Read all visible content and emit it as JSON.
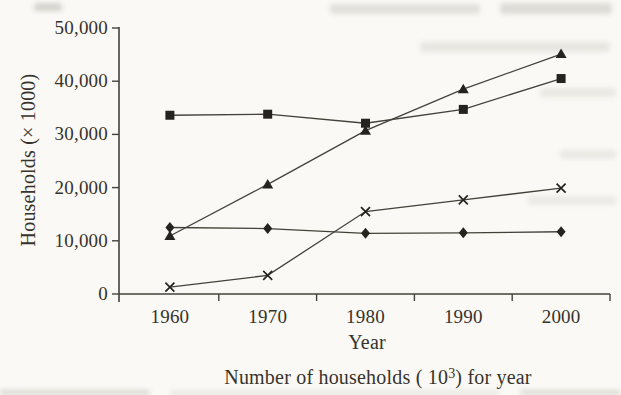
{
  "page": {
    "background_color": "#faf9f5",
    "ink_color": "#37332c",
    "line_color": "#45413a",
    "marker_color": "#26231e"
  },
  "chart_data": {
    "type": "line",
    "title": "",
    "xlabel": "Year",
    "ylabel": "Households (× 1000)",
    "caption": {
      "prefix": "Number of households ( 10",
      "superscript": "3",
      "suffix": ") for year"
    },
    "x": [
      1960,
      1970,
      1980,
      1990,
      2000
    ],
    "x_tick_labels": [
      "1960",
      "1970",
      "1980",
      "1990",
      "2000"
    ],
    "y_tick_labels": [
      "50,000",
      "40,000",
      "30,000",
      "20,000",
      "10,000",
      "0"
    ],
    "ylim": [
      0,
      50000
    ],
    "y_tick_step": 10000,
    "grid": false,
    "legend_position": "none",
    "series": [
      {
        "name": "triangle-series",
        "marker": "triangle",
        "values": [
          10900,
          20600,
          30700,
          38500,
          45100
        ]
      },
      {
        "name": "square-series",
        "marker": "square",
        "values": [
          33600,
          33800,
          32100,
          34700,
          40500
        ]
      },
      {
        "name": "x-series",
        "marker": "x",
        "values": [
          1300,
          3500,
          15500,
          17700,
          19900
        ]
      },
      {
        "name": "diamond-series",
        "marker": "diamond",
        "values": [
          12500,
          12300,
          11400,
          11500,
          11700
        ]
      }
    ]
  }
}
